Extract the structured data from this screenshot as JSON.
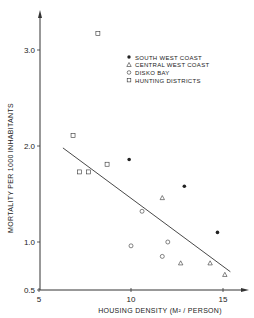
{
  "chart_data": {
    "type": "scatter",
    "title": "",
    "xlabel": "HOUSING DENSITY (M² / PERSON)",
    "ylabel": "MORTALITY PER 1000 INHABITANTS",
    "xlim": [
      5,
      16.3
    ],
    "ylim": [
      0.5,
      3.5
    ],
    "x_ticks": [
      5,
      10,
      15
    ],
    "x_tick_labels": [
      "5",
      "10",
      "15"
    ],
    "y_ticks": [
      0.5,
      1.0,
      2.0,
      3.0
    ],
    "y_tick_labels": [
      "0.5",
      "1.0",
      "2.0",
      "3.0"
    ],
    "grid": false,
    "legend_position": "upper right",
    "series": [
      {
        "name": "SOUTH WEST COAST",
        "marker": "filled-circle",
        "points": [
          [
            9.9,
            1.86
          ],
          [
            12.9,
            1.58
          ],
          [
            14.7,
            1.1
          ]
        ]
      },
      {
        "name": "CENTRAL WEST COAST",
        "marker": "triangle",
        "points": [
          [
            11.7,
            1.46
          ],
          [
            12.7,
            0.78
          ],
          [
            14.3,
            0.78
          ],
          [
            15.1,
            0.66
          ]
        ]
      },
      {
        "name": "DISKO BAY",
        "marker": "circle",
        "points": [
          [
            10.0,
            0.96
          ],
          [
            10.6,
            1.32
          ],
          [
            11.7,
            0.85
          ],
          [
            12.0,
            1.0
          ]
        ]
      },
      {
        "name": "HUNTING DISTRICTS",
        "marker": "square",
        "points": [
          [
            6.85,
            2.11
          ],
          [
            7.2,
            1.73
          ],
          [
            7.7,
            1.73
          ],
          [
            8.2,
            3.17
          ],
          [
            8.7,
            1.81
          ]
        ]
      }
    ],
    "regression_line": {
      "x": [
        6.3,
        15.4
      ],
      "y": [
        1.98,
        0.69
      ]
    }
  },
  "legend": {
    "items": [
      {
        "label": "SOUTH WEST COAST",
        "marker": "filled-circle"
      },
      {
        "label": "CENTRAL WEST COAST",
        "marker": "triangle"
      },
      {
        "label": "DISKO BAY",
        "marker": "circle"
      },
      {
        "label": "HUNTING DISTRICTS",
        "marker": "square"
      }
    ]
  },
  "colors": {
    "ink": "#222222",
    "background": "#ffffff"
  }
}
